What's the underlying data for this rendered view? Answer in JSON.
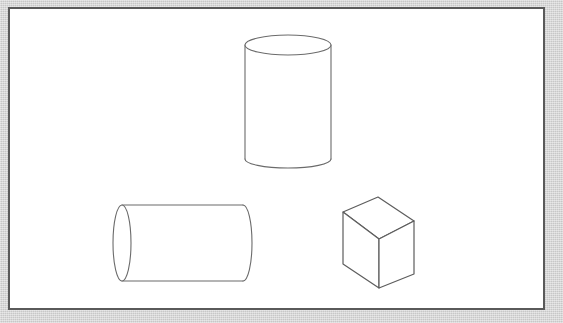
{
  "page": {
    "title": "Geometric Solids Line Drawing",
    "width": 563,
    "height": 323,
    "background_color": "#ffffff"
  },
  "border": {
    "margin_color": "#cfcfcf",
    "frame_color": "#5a5a5a",
    "frame_width_px": 2,
    "canvas_color": "#ffffff",
    "margin_px": 8
  },
  "drawing": {
    "style": "outline line art, no shading, no fill",
    "stroke_color": "#6b6b6b",
    "stroke_width": 1.1,
    "shape_count": 3,
    "caption": "",
    "shapes": [
      {
        "id": "upright-cylinder",
        "name": "Upright Cylinder",
        "type": "cylinder",
        "orientation": "vertical",
        "position": "top-center",
        "bbox": {
          "x": 244,
          "y": 35,
          "width": 88,
          "height": 134
        },
        "geometry": {
          "top_ellipse": {
            "cx": 288,
            "cy": 45,
            "rx": 43,
            "ry": 10
          },
          "bottom_arc": {
            "cx": 288,
            "cy": 159,
            "rx": 43,
            "ry": 9,
            "visible": "front-half-only"
          },
          "left_wall": {
            "x": 245,
            "y1": 45,
            "y2": 159
          },
          "right_wall": {
            "x": 331,
            "y1": 45,
            "y2": 159
          }
        }
      },
      {
        "id": "lying-cylinder",
        "name": "Reclining Cylinder",
        "type": "cylinder",
        "orientation": "horizontal",
        "position": "bottom-left",
        "bbox": {
          "x": 113,
          "y": 205,
          "width": 134,
          "height": 76
        },
        "geometry": {
          "left_ellipse": {
            "cx": 122,
            "cy": 243,
            "rx": 9,
            "ry": 38
          },
          "right_arc": {
            "cx": 243,
            "cy": 243,
            "rx": 9,
            "ry": 38,
            "visible": "front-half-only"
          },
          "top_wall": {
            "y": 205,
            "x1": 122,
            "x2": 243
          },
          "bottom_wall": {
            "y": 281,
            "x1": 122,
            "x2": 243
          }
        }
      },
      {
        "id": "cube",
        "name": "Cube",
        "type": "cube",
        "orientation": "three-quarter view",
        "position": "bottom-right",
        "bbox": {
          "x": 343,
          "y": 197,
          "width": 72,
          "height": 91
        },
        "geometry": {
          "vertices": {
            "top_back": [
              378,
              197
            ],
            "top_left": [
              343,
              212
            ],
            "top_right": [
              414,
              221
            ],
            "top_front": [
              379,
              239
            ],
            "bottom_left": [
              343,
              264
            ],
            "bottom_right": [
              414,
              274
            ],
            "bottom_front": [
              379,
              288
            ]
          },
          "visible_faces": [
            "top",
            "left",
            "right"
          ],
          "hidden_edges": "none drawn"
        }
      }
    ]
  }
}
